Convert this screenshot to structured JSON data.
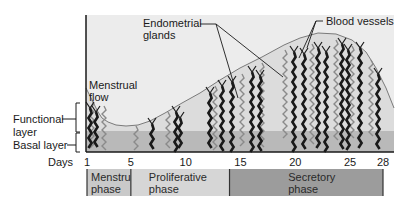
{
  "labels": {
    "endometrial_glands": [
      "Endometrial",
      "glands"
    ],
    "blood_vessels": "Blood vessels",
    "menstrual_flow": [
      "Menstrual",
      "flow"
    ],
    "functional_layer": [
      "Functional",
      "layer"
    ],
    "basal_layer": "Basal layer",
    "days": "Days"
  },
  "day_ticks": [
    "1",
    "5",
    "10",
    "15",
    "20",
    "25",
    "28"
  ],
  "day_tick_values": [
    1,
    5,
    10,
    15,
    20,
    25,
    28
  ],
  "phases": [
    {
      "name": [
        "Menstrual",
        "phase"
      ],
      "start_day": 1,
      "end_day": 5,
      "color": "#c9c9c9"
    },
    {
      "name": [
        "Proliferative",
        "phase"
      ],
      "start_day": 5,
      "end_day": 14,
      "color": "#d6d6d6"
    },
    {
      "name": [
        "Secretory",
        "phase"
      ],
      "start_day": 14,
      "end_day": 28,
      "color": "#9c9c9c"
    }
  ],
  "colors": {
    "background": "#ececec",
    "functional_layer": "#dcdcdc",
    "basal_layer": "#b9b9b9",
    "vessel": "#1a1a1a",
    "gland": "#8a8a8a",
    "surface": "#7a7a7a"
  }
}
